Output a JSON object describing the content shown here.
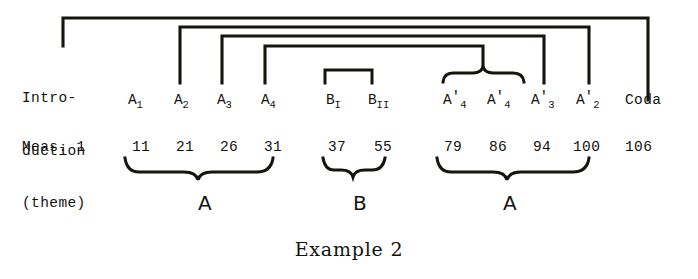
{
  "figure": {
    "caption": "Example 2",
    "intro": {
      "line1": "Intro-",
      "line2": "duction",
      "line3": "(theme)"
    },
    "measure_label": "Meas. 1",
    "first_measure": "1"
  },
  "sections": [
    {
      "name": "A1",
      "base": "A",
      "sub": "1",
      "prime": "",
      "x": 128,
      "measure": "11",
      "measure_x": 132
    },
    {
      "name": "A2",
      "base": "A",
      "sub": "2",
      "prime": "",
      "x": 174,
      "measure": "21",
      "measure_x": 176
    },
    {
      "name": "A3",
      "base": "A",
      "sub": "3",
      "prime": "",
      "x": 217,
      "measure": "26",
      "measure_x": 220
    },
    {
      "name": "A4",
      "base": "A",
      "sub": "4",
      "prime": "",
      "x": 261,
      "measure": "31",
      "measure_x": 264
    },
    {
      "name": "BI",
      "base": "B",
      "sub": "I",
      "prime": "",
      "x": 326,
      "measure": "37",
      "measure_x": 328
    },
    {
      "name": "BII",
      "base": "B",
      "sub": "II",
      "prime": "",
      "x": 368,
      "measure": "55",
      "measure_x": 374
    },
    {
      "name": "A4p",
      "base": "A",
      "sub": "4",
      "prime": "'",
      "x": 443,
      "measure": "79",
      "measure_x": 444
    },
    {
      "name": "A4p2",
      "base": "A",
      "sub": "4",
      "prime": "'",
      "x": 487,
      "measure": "86",
      "measure_x": 489
    },
    {
      "name": "A3p",
      "base": "A",
      "sub": "3",
      "prime": "'",
      "x": 531,
      "measure": "94",
      "measure_x": 533
    },
    {
      "name": "A2p",
      "base": "A",
      "sub": "2",
      "prime": "'",
      "x": 576,
      "measure": "100",
      "measure_x": 573
    },
    {
      "name": "Coda",
      "base": "Coda",
      "sub": "",
      "prime": "",
      "x": 625,
      "measure": "106",
      "measure_x": 625
    }
  ],
  "groups": [
    {
      "letter": "A",
      "x": 198,
      "from_measure": "11",
      "to_measure": "31"
    },
    {
      "letter": "B",
      "x": 353,
      "from_measure": "37",
      "to_measure": "55"
    },
    {
      "letter": "A",
      "x": 503,
      "from_measure": "79",
      "to_measure": "100"
    }
  ],
  "connections": [
    {
      "id": "arc-intro-coda",
      "from": "Introduction (theme)",
      "to": "Coda"
    },
    {
      "id": "arc-a2-a2prime",
      "from": "A2",
      "to": "A2'"
    },
    {
      "id": "arc-a3-a3prime",
      "from": "A3",
      "to": "A3'"
    },
    {
      "id": "arc-a4-a4prime",
      "from": "A4",
      "to": "A4' pair"
    }
  ],
  "colors": {
    "ink": "#17140f",
    "paper": "#ffffff"
  }
}
